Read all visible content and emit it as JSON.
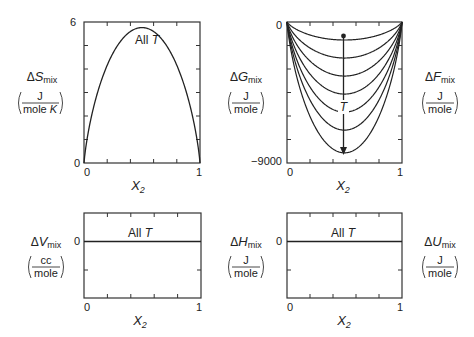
{
  "chart_data": [
    {
      "id": "entropy",
      "type": "line",
      "title": "",
      "ylabel_symbol": "ΔS",
      "ylabel_sub": "mix",
      "units_num": "J",
      "units_den": "mole K",
      "xlabel": "X",
      "xlabel_sub": "2",
      "xticks": [
        "0",
        "1"
      ],
      "yticks": [
        "0",
        "6"
      ],
      "ylim": [
        0,
        6
      ],
      "xlim": [
        0,
        1
      ],
      "annotation": "All T",
      "series": [
        {
          "name": "All T",
          "x": [
            0,
            0.1,
            0.2,
            0.3,
            0.4,
            0.5,
            0.6,
            0.7,
            0.8,
            0.9,
            1
          ],
          "values": [
            0,
            2.7,
            4.16,
            5.08,
            5.59,
            5.76,
            5.59,
            5.08,
            4.16,
            2.7,
            0
          ]
        }
      ]
    },
    {
      "id": "gibbs",
      "type": "line",
      "ylabel_symbol": "ΔG",
      "ylabel_sub": "mix",
      "units_num": "J",
      "units_den": "mole",
      "right_label_symbol": "ΔF",
      "right_label_sub": "mix",
      "right_units_num": "J",
      "right_units_den": "mole",
      "xlabel": "X",
      "xlabel_sub": "2",
      "xticks": [
        "0",
        "1"
      ],
      "yticks": [
        "0",
        "-9000"
      ],
      "ylim": [
        -9000,
        0
      ],
      "xlim": [
        0,
        1
      ],
      "annotation": "T",
      "arrow": "increasing T downward",
      "series": [
        {
          "name": "T1",
          "minimum": -1150
        },
        {
          "name": "T2",
          "minimum": -2300
        },
        {
          "name": "T3",
          "minimum": -3450
        },
        {
          "name": "T4",
          "minimum": -4600
        },
        {
          "name": "T5",
          "minimum": -5750
        },
        {
          "name": "T6",
          "minimum": -6900
        },
        {
          "name": "T7",
          "minimum": -8350
        }
      ]
    },
    {
      "id": "volume",
      "type": "line",
      "ylabel_symbol": "ΔV",
      "ylabel_sub": "mix",
      "units_num": "cc",
      "units_den": "mole",
      "xlabel": "X",
      "xlabel_sub": "2",
      "xticks": [
        "0",
        "1"
      ],
      "yticks": [
        "0"
      ],
      "xlim": [
        0,
        1
      ],
      "annotation": "All T",
      "series": [
        {
          "name": "All T",
          "x": [
            0,
            1
          ],
          "values": [
            0,
            0
          ]
        }
      ]
    },
    {
      "id": "enthalpy",
      "type": "line",
      "ylabel_symbol": "ΔH",
      "ylabel_sub": "mix",
      "units_num": "J",
      "units_den": "mole",
      "right_label_symbol": "ΔU",
      "right_label_sub": "mix",
      "right_units_num": "J",
      "right_units_den": "mole",
      "xlabel": "X",
      "xlabel_sub": "2",
      "xticks": [
        "0",
        "1"
      ],
      "yticks": [
        "0"
      ],
      "xlim": [
        0,
        1
      ],
      "annotation": "All T",
      "series": [
        {
          "name": "All T",
          "x": [
            0,
            1
          ],
          "values": [
            0,
            0
          ]
        }
      ]
    }
  ],
  "labels": {
    "all_t": "All ",
    "t": "T",
    "x": "X",
    "sub2": "2",
    "mix": "mix",
    "delta": "Δ",
    "S": "S",
    "G": "G",
    "F": "F",
    "V": "V",
    "H": "H",
    "U": "U",
    "J": "J",
    "mole": "mole",
    "moleK_a": "mole ",
    "moleK_b": "K",
    "cc": "cc",
    "zero": "0",
    "one": "1",
    "six": "6",
    "neg9000": "−9000"
  }
}
